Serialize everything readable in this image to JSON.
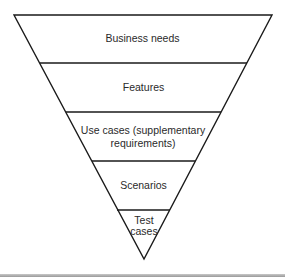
{
  "diagram": {
    "type": "inverted-pyramid",
    "levels": [
      {
        "label": "Business needs"
      },
      {
        "label": "Features"
      },
      {
        "label_line1": "Use cases (supplementary",
        "label_line2": "requirements)"
      },
      {
        "label": "Scenarios"
      },
      {
        "label_line1": "Test",
        "label_line2": "cases"
      }
    ],
    "colors": {
      "stroke": "#1a1a1a",
      "text": "#2a2a2a",
      "background": "#ffffff"
    }
  }
}
